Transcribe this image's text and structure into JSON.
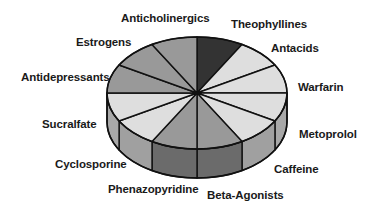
{
  "chart_data": {
    "type": "pie",
    "style": "3d-pie",
    "title": "",
    "start_angle_deg": 0,
    "direction": "clockwise",
    "slices": [
      {
        "label": "Theophyllines",
        "value": 1,
        "top": "#333333",
        "side": "#333333",
        "lx": 231,
        "ly": 28
      },
      {
        "label": "Antacids",
        "value": 1,
        "top": "#dedede",
        "side": "#bbbbbb",
        "lx": 271,
        "ly": 52
      },
      {
        "label": "Warfarin",
        "value": 1,
        "top": "#dedede",
        "side": "#bbbbbb",
        "lx": 298,
        "ly": 91
      },
      {
        "label": "Metoprolol",
        "value": 1,
        "top": "#dedede",
        "side": "#a8a8a8",
        "lx": 299,
        "ly": 138
      },
      {
        "label": "Caffeine",
        "value": 1,
        "top": "#dedede",
        "side": "#a0a0a0",
        "lx": 274,
        "ly": 173
      },
      {
        "label": "Beta-Agonists",
        "value": 1,
        "top": "#999999",
        "side": "#6b6b6b",
        "lx": 207,
        "ly": 199
      },
      {
        "label": "Phenazopyridine",
        "value": 1,
        "top": "#999999",
        "side": "#6b6b6b",
        "lx": 108,
        "ly": 193
      },
      {
        "label": "Cyclosporine",
        "value": 1,
        "top": "#dedede",
        "side": "#a0a0a0",
        "lx": 55,
        "ly": 168
      },
      {
        "label": "Sucralfate",
        "value": 1,
        "top": "#dedede",
        "side": "#a8a8a8",
        "lx": 42,
        "ly": 128
      },
      {
        "label": "Antidepressants",
        "value": 1,
        "top": "#999999",
        "side": "#808080",
        "lx": 21,
        "ly": 81
      },
      {
        "label": "Estrogens",
        "value": 1,
        "top": "#999999",
        "side": "#808080",
        "lx": 76,
        "ly": 46
      },
      {
        "label": "Anticholinergics",
        "value": 1,
        "top": "#999999",
        "side": "#808080",
        "lx": 121,
        "ly": 22
      }
    ],
    "geometry": {
      "cx": 197,
      "cy": 93,
      "rx": 90,
      "ry": 56,
      "depth": 29
    },
    "legend": "none (labels placed around pie)"
  }
}
